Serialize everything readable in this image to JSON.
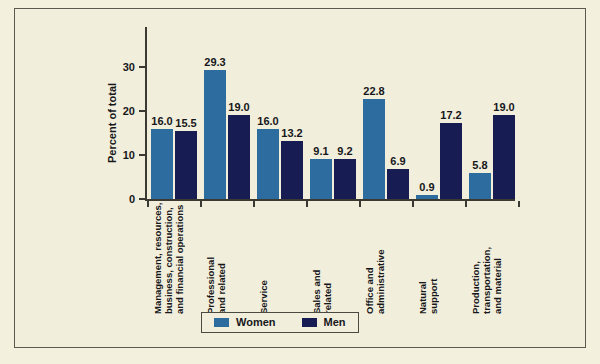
{
  "chart_data": {
    "type": "bar",
    "title": "",
    "xlabel": "",
    "ylabel": "Percent of total",
    "ylim": [
      0,
      34
    ],
    "yticks": [
      0,
      10,
      20,
      30
    ],
    "ytick_labels": [
      "0",
      "10",
      "20",
      "30"
    ],
    "grid": false,
    "legend_position": "bottom-center",
    "categories": [
      "Management, resources,\nbusiness, construction,\nand financial operations",
      "Professional\nand related",
      "Service",
      "Sales and\nrelated",
      "Office and\nadministrative",
      "Natural\nsupport",
      "Production,\ntransportation,\nand material"
    ],
    "series": [
      {
        "name": "Women",
        "color": "#2c6c9f",
        "values": [
          16.0,
          29.3,
          16.0,
          9.1,
          22.8,
          0.9,
          5.8
        ],
        "value_labels": [
          "16.0",
          "29.3",
          "16.0",
          "9.1",
          "22.8",
          "0.9",
          "5.8"
        ]
      },
      {
        "name": "Men",
        "color": "#171c52",
        "values": [
          15.5,
          19.0,
          13.2,
          9.2,
          6.9,
          17.2,
          19.0
        ],
        "value_labels": [
          "15.5",
          "19.0",
          "13.2",
          "9.2",
          "6.9",
          "17.2",
          "19.0"
        ]
      }
    ]
  },
  "legend": {
    "items": [
      {
        "label": "Women",
        "color": "#2c6c9f"
      },
      {
        "label": "Men",
        "color": "#171c52"
      }
    ]
  },
  "colors": {
    "background": "#f1eedc",
    "page_background": "#f3f0de",
    "axis": "#3a3a33",
    "text": "#17171a",
    "women": "#2c6c9f",
    "men": "#171c52"
  }
}
